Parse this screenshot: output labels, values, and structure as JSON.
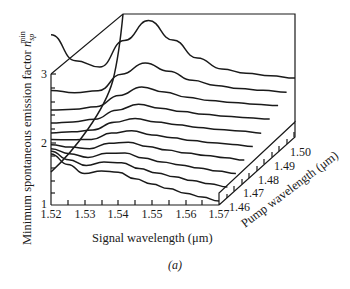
{
  "chart_data": {
    "type": "line",
    "subtype": "3d-waterfall",
    "title": "",
    "caption": "(a)",
    "xlabel": "Signal wavelength (μm)",
    "ylabel": "Minimum spontaneous emission factor n_sp^min",
    "ylabel_main": "Minimum spontaneous emission factor ",
    "ylabel_symbol": "n",
    "ylabel_sub": "sp",
    "ylabel_sup": "min",
    "zlabel": "Pump wavelength (μm)",
    "x_ticks": [
      "1.52",
      "1.53",
      "1.54",
      "1.55",
      "1.56",
      "1.57"
    ],
    "y_ticks": [
      "1",
      "2",
      "3"
    ],
    "z_ticks": [
      "1.46",
      "1.47",
      "1.48",
      "1.49",
      "1.50"
    ],
    "xlim": [
      1.52,
      1.57
    ],
    "ylim": [
      1,
      3
    ],
    "zlim": [
      1.46,
      1.5
    ],
    "x": [
      1.52,
      1.525,
      1.53,
      1.535,
      1.54,
      1.545,
      1.55,
      1.555,
      1.56,
      1.565,
      1.57
    ],
    "series": [
      {
        "name": "1.460",
        "values": [
          1.78,
          1.62,
          1.48,
          1.52,
          1.5,
          1.4,
          1.32,
          1.25,
          1.18,
          1.12,
          1.06
        ]
      },
      {
        "name": "1.465",
        "values": [
          1.82,
          1.68,
          1.58,
          1.62,
          1.6,
          1.5,
          1.42,
          1.35,
          1.28,
          1.22,
          1.16
        ]
      },
      {
        "name": "1.470",
        "values": [
          1.86,
          1.76,
          1.68,
          1.72,
          1.7,
          1.6,
          1.52,
          1.45,
          1.38,
          1.31,
          1.25
        ]
      },
      {
        "name": "1.475",
        "values": [
          1.92,
          1.85,
          1.79,
          1.84,
          1.82,
          1.72,
          1.63,
          1.55,
          1.48,
          1.41,
          1.34
        ]
      },
      {
        "name": "1.480",
        "values": [
          2.0,
          1.95,
          1.91,
          1.96,
          1.95,
          1.84,
          1.75,
          1.66,
          1.58,
          1.51,
          1.43
        ]
      },
      {
        "name": "1.485",
        "values": [
          2.1,
          2.06,
          2.03,
          2.09,
          2.09,
          1.98,
          1.88,
          1.78,
          1.69,
          1.61,
          1.52
        ]
      },
      {
        "name": "1.490",
        "values": [
          2.25,
          2.2,
          2.17,
          2.24,
          2.26,
          2.13,
          2.01,
          1.9,
          1.8,
          1.71,
          1.62
        ]
      },
      {
        "name": "1.495",
        "values": [
          2.45,
          2.38,
          2.34,
          2.43,
          2.48,
          2.32,
          2.16,
          2.03,
          1.92,
          1.81,
          1.71
        ]
      },
      {
        "name": "1.500",
        "values": [
          2.75,
          2.62,
          2.56,
          2.72,
          2.8,
          2.58,
          2.35,
          2.18,
          2.04,
          1.92,
          1.8
        ]
      },
      {
        "name": "1.505",
        "values": [
          3.6,
          3.1,
          2.9,
          3.2,
          3.4,
          3.0,
          2.62,
          2.35,
          2.18,
          2.04,
          1.9
        ]
      }
    ],
    "grid": false,
    "legend": "none"
  },
  "figure": {
    "caption": "(a)"
  }
}
